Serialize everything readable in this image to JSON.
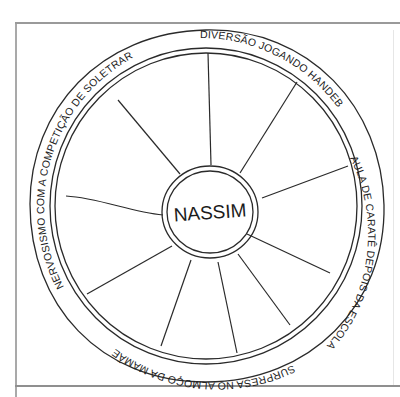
{
  "diagram": {
    "type": "wheel",
    "center_label": "NASSIM",
    "ring_labels": [
      {
        "id": "top-right",
        "text": "DIVERSÃO JOGANDO HANDEBOL"
      },
      {
        "id": "right",
        "text": "AULA DE CARATÊ DEPOIS DA ESCOLA"
      },
      {
        "id": "bottom",
        "text": "SURPRESA NO ALMOÇO DA MAMÃE"
      },
      {
        "id": "left",
        "text": "NERVOSISMO COM A COMPETIÇÃO DE SOLETRAR"
      }
    ],
    "spoke_count": 10,
    "colors": {
      "stroke": "#2a2a2a",
      "frame": "#9a9a9a",
      "background": "#ffffff"
    }
  }
}
